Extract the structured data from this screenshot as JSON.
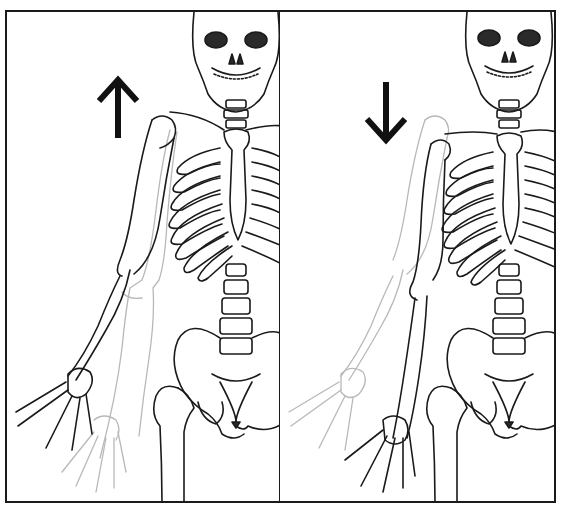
{
  "figure": {
    "alt": "Skeleton illustration showing shoulder elevation and depression",
    "panels": [
      {
        "id": "left",
        "movement": "shoulder elevation",
        "arrow": "up-arrow",
        "arrow_glyph": "↑"
      },
      {
        "id": "right",
        "movement": "shoulder depression",
        "arrow": "down-arrow",
        "arrow_glyph": "↓"
      }
    ]
  },
  "colors": {
    "ink": "#1a1a1a",
    "ghost": "#b8b8b8",
    "background": "#ffffff",
    "fill_dark": "#2a2a2a"
  }
}
